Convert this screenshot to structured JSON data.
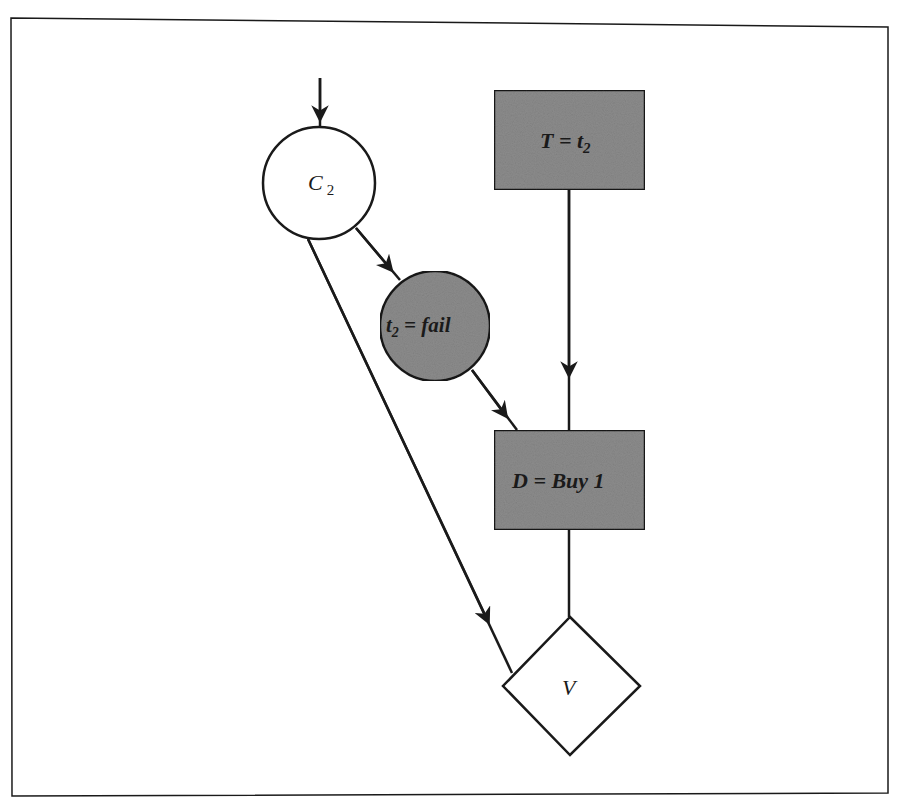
{
  "diagram": {
    "type": "influence-diagram",
    "colors": {
      "line": "#1a1a1a",
      "decision_fill": "#8c8c8c",
      "chance_fill_observed": "#8c8c8c",
      "chance_fill": "#ffffff",
      "value_fill": "#ffffff",
      "background": "#ffffff"
    },
    "nodes": {
      "c2": {
        "id": "C2",
        "shape": "circle",
        "label": "C",
        "subscript": "2"
      },
      "t": {
        "id": "T",
        "shape": "rectangle",
        "label_pre": "T = t",
        "subscript": "2"
      },
      "t2fail": {
        "id": "t2fail",
        "shape": "circle",
        "label_pre": "t",
        "subscript": "2",
        "label_post": " = fail"
      },
      "d": {
        "id": "D",
        "shape": "rectangle",
        "label": "D = Buy 1"
      },
      "v": {
        "id": "V",
        "shape": "diamond",
        "label": "V"
      }
    },
    "edges": [
      {
        "from": "external",
        "to": "C2"
      },
      {
        "from": "C2",
        "to": "t2fail"
      },
      {
        "from": "t2fail",
        "to": "D"
      },
      {
        "from": "T",
        "to": "D"
      },
      {
        "from": "C2",
        "to": "V"
      },
      {
        "from": "D",
        "to": "V"
      }
    ]
  }
}
